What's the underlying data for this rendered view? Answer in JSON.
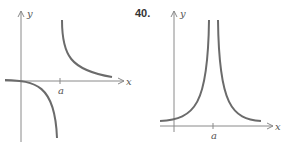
{
  "figures": [
    {
      "number": "",
      "x_label": "x",
      "y_label": "y",
      "tick_label": "a",
      "description": "Graph with vertical asymptote at x = a; function approaches 0 from below as x goes to -infinity, goes to -infinity as x approaches a from left, +infinity from right, then decays to 0 from above"
    },
    {
      "number": "40.",
      "x_label": "x",
      "y_label": "y",
      "tick_label": "a",
      "description": "Graph with vertical asymptote at x = a; function positive on both sides, going to +infinity as x approaches a from either side, approaching 0 as x goes to ±infinity"
    }
  ],
  "colors": {
    "curve": "#6b6b6b",
    "axis": "#8a8a8a",
    "text": "#333333"
  }
}
